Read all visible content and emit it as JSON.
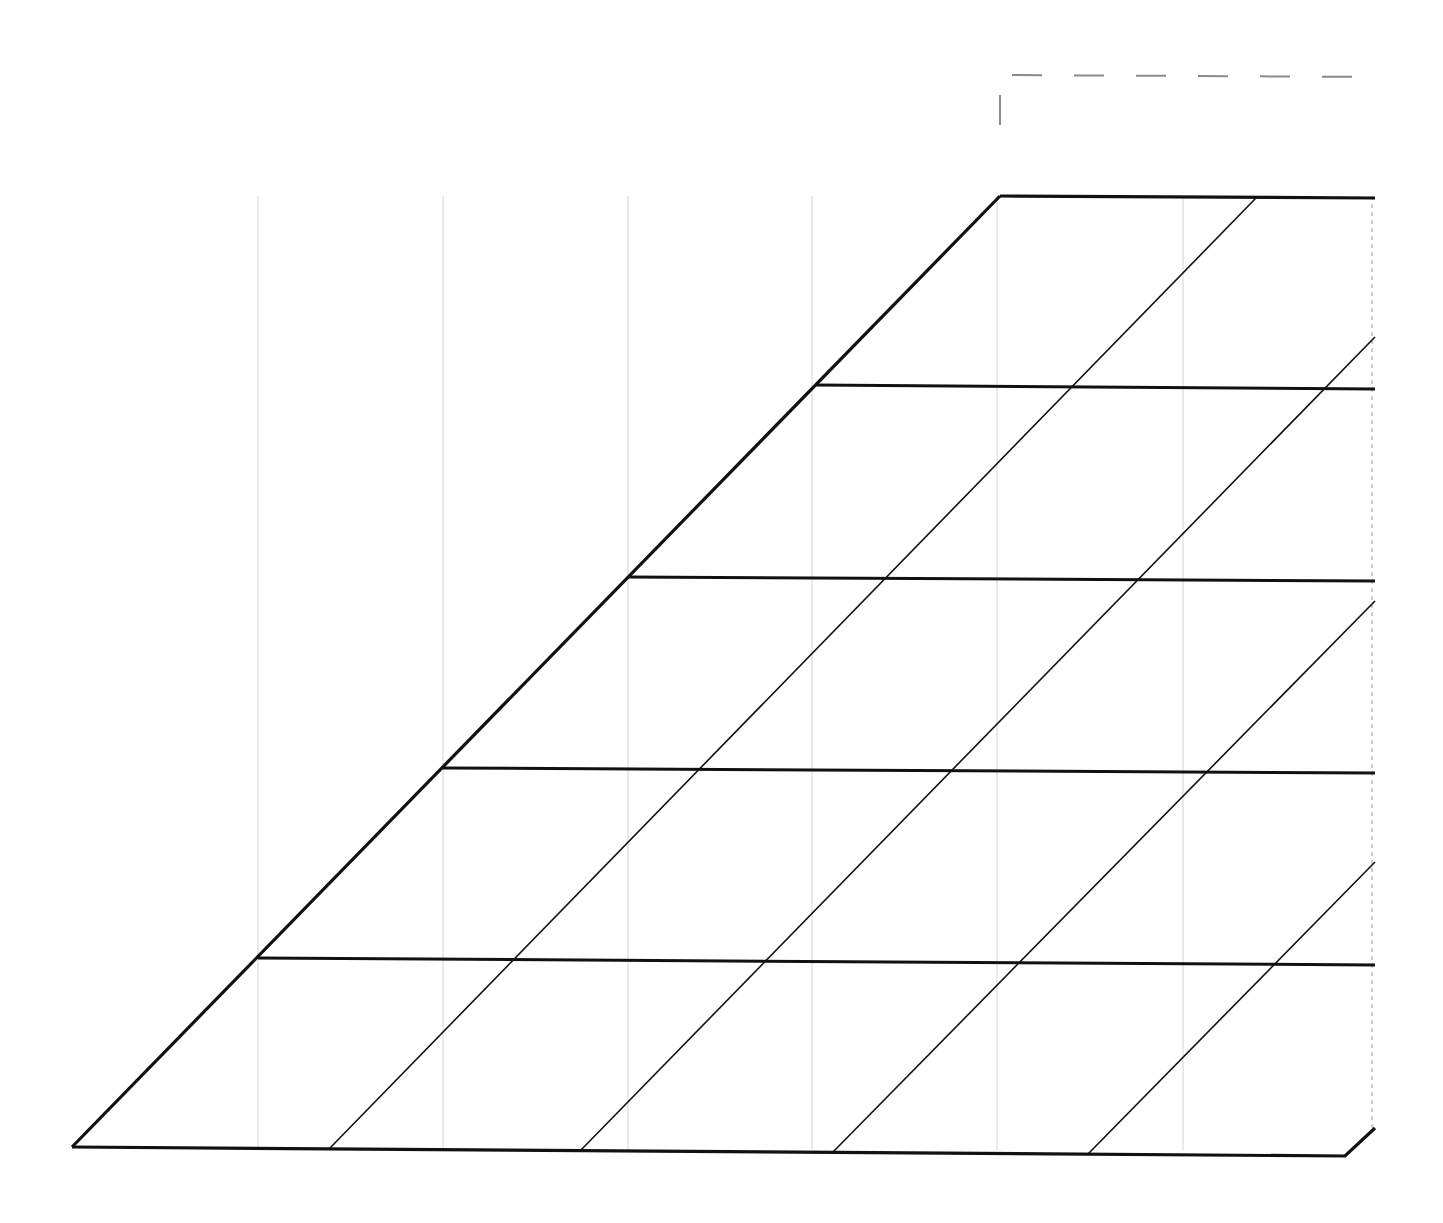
{
  "diagram": {
    "type": "skewed-grid",
    "colors": {
      "background": "#ffffff",
      "stroke": "#111111",
      "guide": "#d4d4d4",
      "dashed_marker": "#8a8a8a",
      "right_dashed_edge": "#9a9a9a"
    },
    "outline": {
      "points": [
        [
          72,
          1147
        ],
        [
          1000,
          196
        ],
        [
          1375,
          198
        ],
        [
          1375,
          1128
        ],
        [
          1345,
          1156
        ],
        [
          72,
          1147
        ]
      ],
      "stroke_width": 3.2
    },
    "horizontal_lines": [
      {
        "x1": 815,
        "y1": 385,
        "x2": 1375,
        "y2": 389
      },
      {
        "x1": 628,
        "y1": 577,
        "x2": 1375,
        "y2": 581
      },
      {
        "x1": 443,
        "y1": 768,
        "x2": 1375,
        "y2": 773
      },
      {
        "x1": 258,
        "y1": 958,
        "x2": 1375,
        "y2": 965
      }
    ],
    "diagonal_lines": [
      {
        "x1": 330,
        "y1": 1148,
        "x2": 1256,
        "y2": 198
      },
      {
        "x1": 581,
        "y1": 1150,
        "x2": 1375,
        "y2": 337
      },
      {
        "x1": 833,
        "y1": 1152,
        "x2": 1375,
        "y2": 601
      },
      {
        "x1": 1088,
        "y1": 1154,
        "x2": 1375,
        "y2": 862
      }
    ],
    "vertical_guides": [
      258,
      443,
      628,
      812,
      997,
      1183
    ],
    "guide_range": {
      "y_top": 196,
      "y_bottom": 1150
    },
    "right_edge_dashed": {
      "x": 1372,
      "y1": 196,
      "y2": 1130
    },
    "corner_marker": {
      "x": 1000,
      "y": 75,
      "horizontal_to": 1380,
      "vertical_to": 125
    }
  }
}
